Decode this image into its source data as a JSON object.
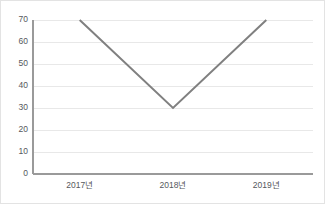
{
  "chart_data": {
    "type": "line",
    "title": "",
    "subtitle": "",
    "xlabel": "",
    "ylabel": "",
    "categories": [
      "2017년",
      "2018년",
      "2019년"
    ],
    "values": [
      70,
      30,
      70
    ],
    "series": [
      {
        "name": "",
        "values": [
          70,
          30,
          70
        ]
      }
    ],
    "ylim": [
      0,
      70
    ],
    "ytick_step": 10,
    "yticks": [
      0,
      10,
      20,
      30,
      40,
      50,
      60,
      70
    ],
    "ytick_labels": [
      "0",
      "10",
      "20",
      "30",
      "40",
      "50",
      "60",
      "70"
    ],
    "xtick_labels": [
      "2017년",
      "2018년",
      "2019년"
    ],
    "grid": true,
    "grid_axis": "y",
    "legend": false,
    "legend_position": "none",
    "annotations": [],
    "colors": {
      "line": "#808080",
      "grid": "#e8e8e8",
      "axis": "#9a9a9a",
      "text": "#55585c",
      "background": "#ffffff",
      "frame": "#e3e3e3"
    }
  }
}
